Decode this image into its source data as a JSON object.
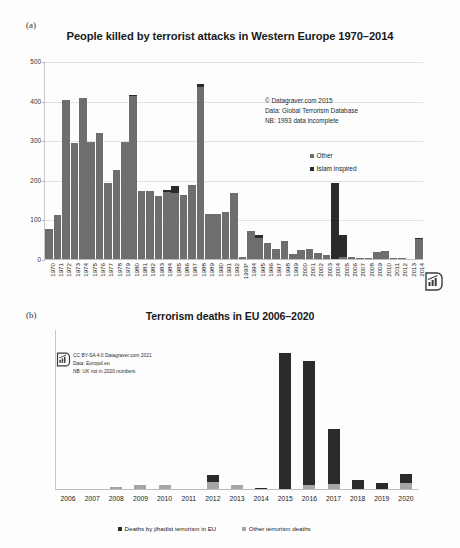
{
  "figure": {
    "panel_a_letter": "(a)",
    "panel_b_letter": "(b)"
  },
  "chart_data": [
    {
      "panel": "(a)",
      "type": "bar",
      "stacked": true,
      "title": "People killed by terrorist attacks in Western Europe 1970–2014",
      "xlabel": "",
      "ylabel": "",
      "ylim": [
        0,
        500
      ],
      "yticks": [
        0,
        100,
        200,
        300,
        400,
        500
      ],
      "grid": true,
      "legend_position": "inside-right",
      "categories": [
        "1970",
        "1971",
        "1972",
        "1973",
        "1974",
        "1975",
        "1976",
        "1977",
        "1978",
        "1979",
        "1980",
        "1981",
        "1982",
        "1983",
        "1984",
        "1985",
        "1986",
        "1987",
        "1988",
        "1989",
        "1990",
        "1991",
        "1992",
        "1993*",
        "1994",
        "1995",
        "1996",
        "1997",
        "1998",
        "1999",
        "2000",
        "2001",
        "2002",
        "2003",
        "2004",
        "2005",
        "2006",
        "2007",
        "2008",
        "2009",
        "2010",
        "2011",
        "2012",
        "2013",
        "2014"
      ],
      "series": [
        {
          "name": "Other",
          "color": "#6e6e6e",
          "values": [
            78,
            114,
            403,
            295,
            409,
            299,
            322,
            194,
            228,
            299,
            415,
            174,
            174,
            162,
            172,
            170,
            163,
            190,
            437,
            117,
            117,
            120,
            168,
            8,
            73,
            55,
            42,
            28,
            49,
            15,
            25,
            28,
            18,
            12,
            3,
            8,
            7,
            4,
            4,
            20,
            22,
            4,
            4,
            2,
            52
          ]
        },
        {
          "name": "Islam inspired",
          "color": "#2b2b2b",
          "values": [
            0,
            0,
            0,
            0,
            0,
            0,
            0,
            0,
            0,
            0,
            2,
            0,
            0,
            0,
            4,
            18,
            2,
            0,
            7,
            0,
            0,
            0,
            0,
            0,
            0,
            8,
            0,
            0,
            0,
            0,
            0,
            0,
            0,
            0,
            192,
            56,
            0,
            0,
            0,
            0,
            0,
            0,
            0,
            0,
            4
          ]
        }
      ],
      "annotations": [
        "© Datagraver.com 2015",
        "Data: Global Terrorism Database",
        "NB: 1993 data incomplete"
      ]
    },
    {
      "panel": "(b)",
      "type": "bar",
      "stacked": true,
      "title": "Terrorism deaths in EU  2006–2020",
      "xlabel": "",
      "ylabel": "",
      "ylim": [
        0,
        175
      ],
      "yticks": [
        0,
        25,
        50,
        75,
        100,
        125,
        150,
        175
      ],
      "grid": false,
      "legend_position": "bottom",
      "categories": [
        "2006",
        "2007",
        "2008",
        "2009",
        "2010",
        "2011",
        "2012",
        "2013",
        "2014",
        "2015",
        "2016",
        "2017",
        "2018",
        "2019",
        "2020"
      ],
      "series": [
        {
          "name": "Deaths by jihadist terrorism in EU",
          "color": "#2b2b2b",
          "values": [
            0,
            0,
            0,
            0,
            0,
            0,
            7,
            0,
            2,
            150,
            135,
            60,
            11,
            8,
            10
          ]
        },
        {
          "name": "Other terrorism deaths",
          "color": "#a6a6a6",
          "values": [
            1,
            1,
            3,
            6,
            6,
            1,
            9,
            5,
            0,
            0,
            6,
            7,
            0,
            0,
            8
          ]
        }
      ],
      "annotations": [
        "CC BY-SA 4.0 Datagraver.com 2021",
        "Data: Europol.eu",
        "NB: UK not in 2020 numbers"
      ]
    }
  ]
}
